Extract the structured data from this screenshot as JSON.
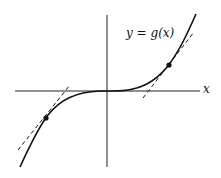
{
  "diagram": {
    "curve_label": "y = g(x)",
    "x_axis_label": "x",
    "marked_points": [
      {
        "name": "left-point",
        "px": [
          46,
          118
        ]
      },
      {
        "name": "right-point",
        "px": [
          169,
          65
        ]
      }
    ],
    "colors": {
      "line": "#111111",
      "background": "#ffffff"
    }
  }
}
